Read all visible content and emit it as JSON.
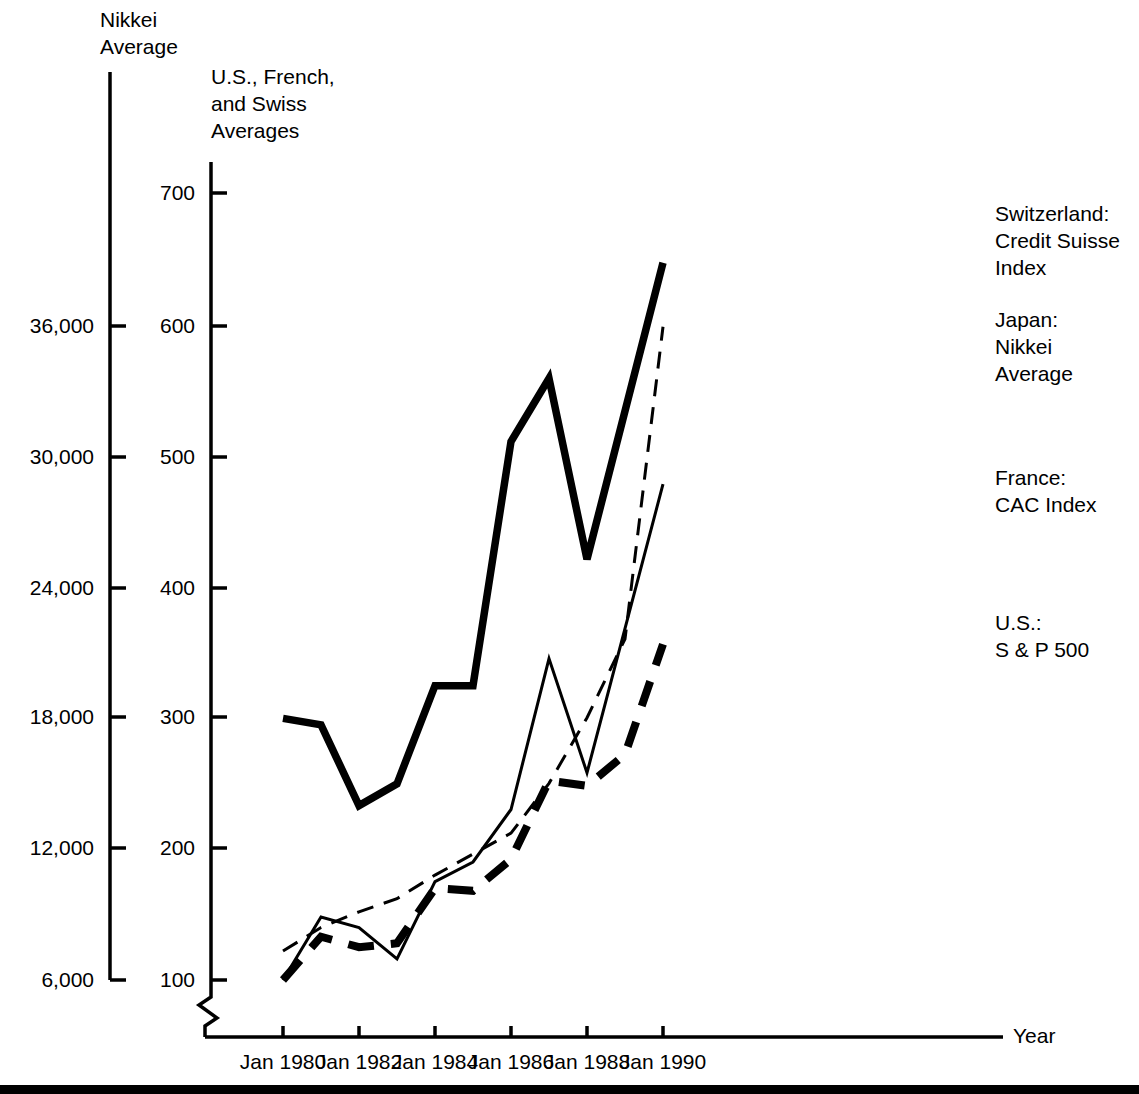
{
  "chart_data": {
    "type": "line",
    "title": "",
    "xlabel": "Year",
    "x_tick_labels": [
      "Jan 1980",
      "Jan 1982",
      "Jan 1984",
      "Jan 1986",
      "Jan 1988",
      "Jan 1990"
    ],
    "x_tick_values": [
      1980,
      1982,
      1984,
      1986,
      1988,
      1990
    ],
    "xlim": [
      1980,
      1990
    ],
    "grid": false,
    "legend_position": "right-inline",
    "axes": [
      {
        "id": "left",
        "name": "Nikkei Average",
        "title_lines": [
          "Nikkei",
          "Average"
        ],
        "tick_labels": [
          "36,000",
          "30,000",
          "24,000",
          "18,000",
          "12,000",
          "6,000"
        ],
        "tick_values": [
          36000,
          30000,
          24000,
          18000,
          12000,
          6000
        ],
        "ylim": [
          6000,
          42000
        ],
        "axis_break": true
      },
      {
        "id": "right-inner",
        "name": "U.S., French, and Swiss Averages",
        "title_lines": [
          "U.S., French,",
          "and Swiss",
          "Averages"
        ],
        "tick_labels": [
          "700",
          "600",
          "500",
          "400",
          "300",
          "200",
          "100"
        ],
        "tick_values": [
          700,
          600,
          500,
          400,
          300,
          200,
          100
        ],
        "ylim": [
          100,
          700
        ],
        "axis_break": true
      }
    ],
    "series": [
      {
        "name": "Japan: Nikkei Average",
        "label_lines": [
          "Japan:",
          "Nikkei",
          "Average"
        ],
        "axis": "left",
        "style": "solid",
        "stroke_width": 7,
        "color": "#000000",
        "x": [
          1980,
          1981,
          1982,
          1983,
          1984,
          1985,
          1986,
          1987,
          1988,
          1990
        ],
        "values": [
          18000,
          17700,
          14000,
          15000,
          19500,
          19500,
          30700,
          33600,
          25300,
          38900
        ]
      },
      {
        "name": "Switzerland: Credit Suisse Index",
        "label_lines": [
          "Switzerland:",
          "Credit Suisse",
          "Index"
        ],
        "axis": "right-inner",
        "style": "dashed",
        "stroke_width": 3,
        "color": "#000000",
        "x": [
          1980,
          1981,
          1982,
          1983,
          1984,
          1985,
          1986,
          1987,
          1988,
          1989,
          1990
        ],
        "values": [
          122,
          140,
          152,
          162,
          180,
          196,
          212,
          250,
          300,
          360,
          598
        ]
      },
      {
        "name": "France: CAC Index",
        "label_lines": [
          "France:",
          "CAC Index"
        ],
        "axis": "right-inner",
        "style": "solid",
        "stroke_width": 3,
        "color": "#000000",
        "x": [
          1980,
          1981,
          1982,
          1983,
          1984,
          1985,
          1986,
          1987,
          1988,
          1990
        ],
        "values": [
          100,
          148,
          140,
          116,
          175,
          190,
          230,
          345,
          258,
          478
        ]
      },
      {
        "name": "U.S.: S & P 500",
        "label_lines": [
          "U.S.:",
          "S & P 500"
        ],
        "axis": "right-inner",
        "style": "dashed",
        "stroke_width": 7,
        "color": "#000000",
        "x": [
          1980,
          1981,
          1982,
          1983,
          1984,
          1985,
          1986,
          1987,
          1988,
          1989,
          1990
        ],
        "values": [
          100,
          133,
          125,
          128,
          170,
          168,
          192,
          252,
          248,
          272,
          356
        ]
      }
    ]
  },
  "labels": {
    "left_axis_title": "Nikkei\nAverage",
    "inner_axis_title": "U.S., French,\nand Swiss\nAverages",
    "x_axis_name": "Year",
    "series_switzerland": "Switzerland:\nCredit Suisse\nIndex",
    "series_japan": "Japan:\nNikkei\nAverage",
    "series_france": "France:\nCAC Index",
    "series_us": "U.S.:\nS & P 500"
  },
  "ticks": {
    "left": [
      "36,000",
      "30,000",
      "24,000",
      "18,000",
      "12,000",
      "6,000"
    ],
    "inner": [
      "700",
      "600",
      "500",
      "400",
      "300",
      "200",
      "100"
    ],
    "x": [
      "Jan 1980",
      "Jan 1982",
      "Jan 1984",
      "Jan 1986",
      "Jan 1988",
      "Jan 1990"
    ]
  },
  "colors": {
    "ink": "#000000",
    "background": "#ffffff"
  }
}
